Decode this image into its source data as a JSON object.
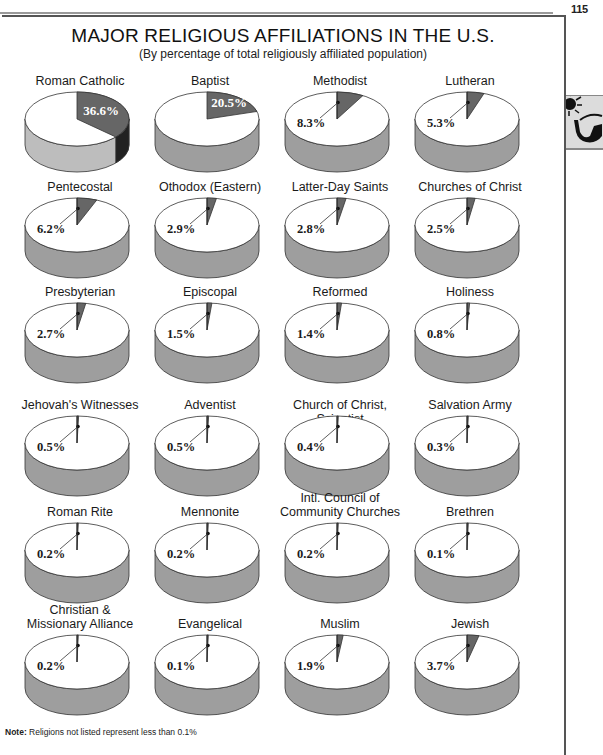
{
  "page": {
    "number": "115"
  },
  "chart_data": {
    "type": "pie",
    "title": "MAJOR RELIGIOUS AFFILIATIONS IN THE U.S.",
    "subtitle": "(By percentage of total religiously affiliated population)",
    "unit": "percent of total religiously affiliated population",
    "layout": {
      "columns": 4,
      "rows": 6,
      "style": "3d-pie-per-category",
      "legend": "none"
    },
    "categories": [
      "Roman Catholic",
      "Baptist",
      "Methodist",
      "Lutheran",
      "Pentecostal",
      "Othodox (Eastern)",
      "Latter-Day Saints",
      "Churches of Christ",
      "Presbyterian",
      "Episcopal",
      "Reformed",
      "Holiness",
      "Jehovah's Witnesses",
      "Adventist",
      "Church of Christ, Scientist",
      "Salvation Army",
      "Roman Rite",
      "Mennonite",
      "Intl. Council of Community Churches",
      "Brethren",
      "Christian & Missionary Alliance",
      "Evangelical",
      "Muslim",
      "Jewish"
    ],
    "values": [
      36.6,
      20.5,
      8.3,
      5.3,
      6.2,
      2.9,
      2.8,
      2.5,
      2.7,
      1.5,
      1.4,
      0.8,
      0.5,
      0.5,
      0.4,
      0.3,
      0.2,
      0.2,
      0.2,
      0.1,
      0.2,
      0.1,
      1.9,
      3.7
    ],
    "pies": [
      {
        "label_lines": [
          "Roman Catholic"
        ],
        "value": 36.6,
        "value_label": "36.6%",
        "label_inside": true
      },
      {
        "label_lines": [
          "Baptist"
        ],
        "value": 20.5,
        "value_label": "20.5%",
        "label_inside": true
      },
      {
        "label_lines": [
          "Methodist"
        ],
        "value": 8.3,
        "value_label": "8.3%",
        "label_inside": false
      },
      {
        "label_lines": [
          "Lutheran"
        ],
        "value": 5.3,
        "value_label": "5.3%",
        "label_inside": false
      },
      {
        "label_lines": [
          "Pentecostal"
        ],
        "value": 6.2,
        "value_label": "6.2%",
        "label_inside": false
      },
      {
        "label_lines": [
          "Othodox (Eastern)"
        ],
        "value": 2.9,
        "value_label": "2.9%",
        "label_inside": false
      },
      {
        "label_lines": [
          "Latter-Day Saints"
        ],
        "value": 2.8,
        "value_label": "2.8%",
        "label_inside": false
      },
      {
        "label_lines": [
          "Churches of Christ"
        ],
        "value": 2.5,
        "value_label": "2.5%",
        "label_inside": false
      },
      {
        "label_lines": [
          "Presbyterian"
        ],
        "value": 2.7,
        "value_label": "2.7%",
        "label_inside": false
      },
      {
        "label_lines": [
          "Episcopal"
        ],
        "value": 1.5,
        "value_label": "1.5%",
        "label_inside": false
      },
      {
        "label_lines": [
          "Reformed"
        ],
        "value": 1.4,
        "value_label": "1.4%",
        "label_inside": false
      },
      {
        "label_lines": [
          "Holiness"
        ],
        "value": 0.8,
        "value_label": "0.8%",
        "label_inside": false
      },
      {
        "label_lines": [
          "Jehovah's Witnesses"
        ],
        "value": 0.5,
        "value_label": "0.5%",
        "label_inside": false
      },
      {
        "label_lines": [
          "Adventist"
        ],
        "value": 0.5,
        "value_label": "0.5%",
        "label_inside": false
      },
      {
        "label_lines": [
          "Church of Christ, Scientist"
        ],
        "value": 0.4,
        "value_label": "0.4%",
        "label_inside": false
      },
      {
        "label_lines": [
          "Salvation Army"
        ],
        "value": 0.3,
        "value_label": "0.3%",
        "label_inside": false
      },
      {
        "label_lines": [
          "Roman Rite"
        ],
        "value": 0.2,
        "value_label": "0.2%",
        "label_inside": false
      },
      {
        "label_lines": [
          "Mennonite"
        ],
        "value": 0.2,
        "value_label": "0.2%",
        "label_inside": false
      },
      {
        "label_lines": [
          "Intl. Council of",
          "Community Churches"
        ],
        "value": 0.2,
        "value_label": "0.2%",
        "label_inside": false
      },
      {
        "label_lines": [
          "Brethren"
        ],
        "value": 0.1,
        "value_label": "0.1%",
        "label_inside": false
      },
      {
        "label_lines": [
          "Christian &",
          "Missionary Alliance"
        ],
        "value": 0.2,
        "value_label": "0.2%",
        "label_inside": false
      },
      {
        "label_lines": [
          "Evangelical"
        ],
        "value": 0.1,
        "value_label": "0.1%",
        "label_inside": false
      },
      {
        "label_lines": [
          "Muslim"
        ],
        "value": 1.9,
        "value_label": "1.9%",
        "label_inside": false
      },
      {
        "label_lines": [
          "Jewish"
        ],
        "value": 3.7,
        "value_label": "3.7%",
        "label_inside": false
      }
    ],
    "annotations": [
      "Note: Religions not listed represent less than 0.1%"
    ]
  },
  "note": {
    "prefix": "Note:",
    "text": " Religions not listed represent less than 0.1%"
  },
  "colors": {
    "slice_fill": "#666666",
    "slice_side": "#222222",
    "top_fill": "#ffffff",
    "side_fill": "#9e9e9e",
    "side_fill_light": "#bdbdbd",
    "outline": "#333333",
    "tab_bg": "#dcdcdc"
  },
  "icons": {
    "tab_art": "sun-and-sunglasses-icon"
  }
}
